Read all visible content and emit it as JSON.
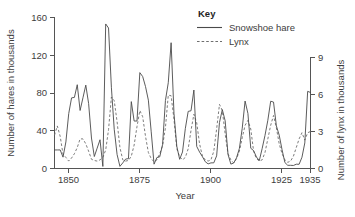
{
  "chart_data": {
    "type": "line",
    "title": "",
    "xlabel": "Year",
    "ylabel": "Number of hares in thousands",
    "ylabel_right": "Number of lynx in thousands",
    "xlim": [
      1845,
      1935
    ],
    "ylim": [
      0,
      160
    ],
    "ylim_right": [
      0,
      9
    ],
    "grid": false,
    "legend_position": "top-right",
    "legend_title": "Key",
    "x_ticks": [
      1850,
      1875,
      1900,
      1925,
      1935
    ],
    "x_tick_labels": [
      "1850",
      "1875",
      "1900",
      "1925",
      "1935"
    ],
    "y_ticks": [
      0,
      40,
      80,
      120,
      160
    ],
    "y_tick_labels": [
      "0",
      "40",
      "80",
      "120",
      "160"
    ],
    "y_ticks_right": [
      0,
      3,
      6,
      9
    ],
    "y_tick_labels_right": [
      "0",
      "3",
      "6",
      "9"
    ],
    "x": [
      1845,
      1846,
      1847,
      1848,
      1849,
      1850,
      1851,
      1852,
      1853,
      1854,
      1855,
      1856,
      1857,
      1858,
      1859,
      1860,
      1861,
      1862,
      1863,
      1864,
      1865,
      1866,
      1867,
      1868,
      1869,
      1870,
      1871,
      1872,
      1873,
      1874,
      1875,
      1876,
      1877,
      1878,
      1879,
      1880,
      1881,
      1882,
      1883,
      1884,
      1885,
      1886,
      1887,
      1888,
      1889,
      1890,
      1891,
      1892,
      1893,
      1894,
      1895,
      1896,
      1897,
      1898,
      1899,
      1900,
      1901,
      1902,
      1903,
      1904,
      1905,
      1906,
      1907,
      1908,
      1909,
      1910,
      1911,
      1912,
      1913,
      1914,
      1915,
      1916,
      1917,
      1918,
      1919,
      1920,
      1921,
      1922,
      1923,
      1924,
      1925,
      1926,
      1927,
      1928,
      1929,
      1930,
      1931,
      1932,
      1933,
      1934,
      1935
    ],
    "series": [
      {
        "name": "Snowshoe hare",
        "style": "solid",
        "axis": "left",
        "units": "thousands of hares",
        "values": [
          19.58,
          19.6,
          19.61,
          11.99,
          28.04,
          58.0,
          74.6,
          75.09,
          88.48,
          61.28,
          74.67,
          88.06,
          68.51,
          32.19,
          12.64,
          21.49,
          30.35,
          2.18,
          152.65,
          148.36,
          85.81,
          41.41,
          14.75,
          2.28,
          5.91,
          9.95,
          10.44,
          70.64,
          50.12,
          50.13,
          101.25,
          97.12,
          86.51,
          72.17,
          38.77,
          4.57,
          11.61,
          12.35,
          25.34,
          71.77,
          90.6,
          132.83,
          58.24,
          23.45,
          9.7,
          17.46,
          42.23,
          60.34,
          60.97,
          82.87,
          23.3,
          17.36,
          12.52,
          7.19,
          4.88,
          5.92,
          5.99,
          13.36,
          48.61,
          62.14,
          50.36,
          14.94,
          4.65,
          5.77,
          11.27,
          21.19,
          42.45,
          71.22,
          58.12,
          21.37,
          18.85,
          12.1,
          8.37,
          20.96,
          34.93,
          50.93,
          71.04,
          70.18,
          45.05,
          35.19,
          19.83,
          6.27,
          3.38,
          3.36,
          3.2,
          4.53,
          4.46,
          11.91,
          27.0,
          81.49,
          80.27
        ]
      },
      {
        "name": "Lynx",
        "style": "dashed",
        "axis": "right",
        "units": "thousands of lynx",
        "values": [
          2.7,
          3.45,
          2.6,
          1.16,
          0.9,
          0.6,
          0.85,
          1.2,
          1.7,
          2.4,
          2.4,
          2.0,
          1.4,
          0.75,
          0.65,
          0.6,
          0.7,
          0.9,
          1.5,
          3.15,
          5.8,
          5.5,
          3.8,
          1.7,
          0.7,
          0.6,
          0.65,
          1.0,
          1.9,
          3.4,
          4.7,
          4.2,
          2.6,
          1.3,
          0.8,
          0.55,
          0.7,
          1.2,
          1.85,
          3.3,
          5.95,
          5.9,
          4.0,
          1.6,
          0.95,
          0.7,
          0.9,
          1.6,
          3.1,
          4.4,
          3.7,
          2.0,
          1.0,
          0.7,
          0.6,
          0.7,
          1.4,
          3.2,
          5.2,
          4.7,
          2.8,
          1.2,
          0.7,
          0.45,
          0.8,
          1.4,
          2.5,
          3.5,
          3.9,
          3.2,
          1.4,
          0.8,
          0.6,
          0.7,
          1.3,
          2.4,
          3.5,
          4.3,
          3.3,
          2.0,
          1.2,
          0.7,
          0.5,
          0.6,
          1.0,
          1.7,
          2.4,
          2.9,
          2.3,
          2.9,
          3.0
        ]
      }
    ]
  },
  "axes": {
    "left_title": "Number of hares in thousands",
    "right_title": "Number of lynx in thousands",
    "bottom_title": "Year"
  },
  "legend": {
    "title": "Key",
    "items": [
      {
        "label": "Snowshoe hare",
        "style": "solid"
      },
      {
        "label": "Lynx",
        "style": "dashed"
      }
    ]
  },
  "colors": {
    "hare_line": "#4a4a4a",
    "lynx_line": "#6e6e6e",
    "axis": "#555555",
    "text": "#3d3d3d",
    "background": "#ffffff"
  }
}
